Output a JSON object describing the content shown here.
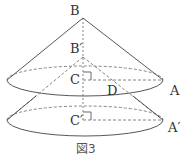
{
  "labels": {
    "B": "B",
    "B_prime": "B′",
    "C": "C",
    "C_prime": "C′",
    "D": "D",
    "A": "A",
    "A_prime": "A′"
  },
  "caption": "図3",
  "colors": {
    "line": "#444444",
    "dash": "#666666"
  }
}
